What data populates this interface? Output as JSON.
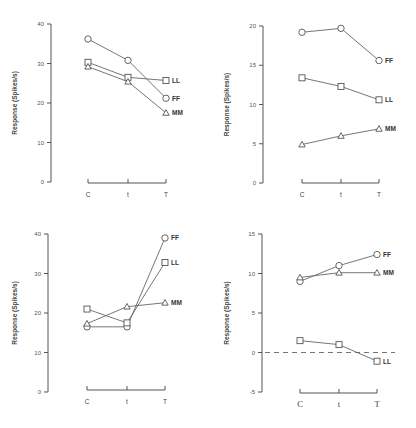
{
  "chart_data": [
    {
      "type": "line",
      "panel": "top-left",
      "title": "",
      "xlabel": "",
      "ylabel": "Response (Spikes/s)",
      "categories": [
        "C",
        "t",
        "T"
      ],
      "ylim": [
        0,
        40
      ],
      "yticks": [
        0,
        10,
        20,
        30,
        40
      ],
      "grid": false,
      "series": [
        {
          "name": "LL",
          "marker": "square",
          "values": [
            30.3,
            26.5,
            25.7
          ]
        },
        {
          "name": "FF",
          "marker": "circle",
          "values": [
            36.2,
            30.8,
            21.2
          ]
        },
        {
          "name": "MM",
          "marker": "triangle",
          "values": [
            29.2,
            25.4,
            17.5
          ]
        }
      ]
    },
    {
      "type": "line",
      "panel": "top-right",
      "title": "",
      "xlabel": "",
      "ylabel": "Response (Spikes/s)",
      "categories": [
        "C",
        "t",
        "T"
      ],
      "ylim": [
        0,
        20
      ],
      "yticks": [
        0,
        5,
        10,
        15,
        20
      ],
      "grid": false,
      "series": [
        {
          "name": "FF",
          "marker": "circle",
          "values": [
            19.2,
            19.7,
            15.6
          ]
        },
        {
          "name": "LL",
          "marker": "square",
          "values": [
            13.4,
            12.3,
            10.6
          ]
        },
        {
          "name": "MM",
          "marker": "triangle",
          "values": [
            4.9,
            6.0,
            6.9
          ]
        }
      ]
    },
    {
      "type": "line",
      "panel": "bottom-left",
      "title": "",
      "xlabel": "",
      "ylabel": "Response (Spikes/s)",
      "categories": [
        "C",
        "t",
        "T"
      ],
      "ylim": [
        0,
        40
      ],
      "yticks": [
        0,
        10,
        20,
        30,
        40
      ],
      "grid": false,
      "series": [
        {
          "name": "FF",
          "marker": "circle",
          "values": [
            16.5,
            16.5,
            39.0
          ]
        },
        {
          "name": "LL",
          "marker": "square",
          "values": [
            21.0,
            17.5,
            32.8
          ]
        },
        {
          "name": "MM",
          "marker": "triangle",
          "values": [
            17.3,
            21.6,
            22.6
          ]
        }
      ]
    },
    {
      "type": "line",
      "panel": "bottom-right",
      "title": "",
      "xlabel": "",
      "ylabel": "Response (Spikes/s)",
      "categories": [
        "C",
        "t",
        "T"
      ],
      "ylim": [
        -5,
        15
      ],
      "yticks": [
        -5,
        0,
        5,
        10,
        15
      ],
      "grid": false,
      "reference_line": {
        "y": 0,
        "style": "dashed"
      },
      "series": [
        {
          "name": "FF",
          "marker": "circle",
          "values": [
            9.0,
            11.0,
            12.4
          ]
        },
        {
          "name": "MM",
          "marker": "triangle",
          "values": [
            9.5,
            10.1,
            10.1
          ]
        },
        {
          "name": "LL",
          "marker": "square",
          "values": [
            1.5,
            1.0,
            -1.1
          ]
        }
      ]
    }
  ],
  "panels": [
    {
      "ylabel": "Response (Spikes/s)",
      "ticks": [
        "0",
        "10",
        "20",
        "30",
        "40"
      ],
      "cats": [
        "C",
        "t",
        "T"
      ]
    },
    {
      "ylabel": "Response (Spikes/s)",
      "ticks": [
        "0",
        "5",
        "10",
        "15",
        "20"
      ],
      "cats": [
        "C",
        "t",
        "T"
      ]
    },
    {
      "ylabel": "Response (Spikes/s)",
      "ticks": [
        "0",
        "10",
        "20",
        "30",
        "40"
      ],
      "cats": [
        "C",
        "t",
        "T"
      ]
    },
    {
      "ylabel": "Response (Spikes/s)",
      "ticks": [
        "-5",
        "0",
        "5",
        "10",
        "15"
      ],
      "cats": [
        "C",
        "t",
        "T"
      ]
    }
  ]
}
